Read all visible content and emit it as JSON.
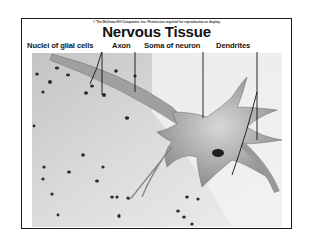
{
  "slide": {
    "copyright": "© The McGraw-Hill Companies, Inc. Permission required for reproduction or display",
    "title": "Nervous Tissue",
    "labels": [
      {
        "id": "glial",
        "text": "Nuclei of glial cells"
      },
      {
        "id": "axon",
        "text": "Axon"
      },
      {
        "id": "soma",
        "text": "Soma of neuron"
      },
      {
        "id": "dendrites",
        "text": "Dendrites"
      }
    ]
  },
  "colors": {
    "border": "#1a1a1a",
    "background_tissue": "#d4d4d4",
    "neuron": "#9c9c9c",
    "nuclei": "#2a2a2a"
  }
}
